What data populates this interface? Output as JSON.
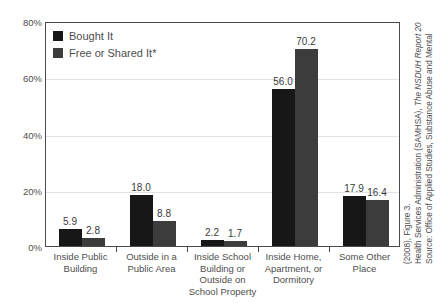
{
  "chart_data": {
    "type": "bar",
    "title": "",
    "subtitle": "",
    "xlabel": "",
    "ylabel": "",
    "ylim": [
      0,
      80
    ],
    "yticks": [
      "0%",
      "20%",
      "40%",
      "60%",
      "80%"
    ],
    "ytick_values": [
      0,
      20,
      40,
      60,
      80
    ],
    "grid": "horizontal",
    "legend_position": "top-left",
    "categories": [
      "Inside Public Building",
      "Outside in a Public Area",
      "Inside School Building or Outside on School Property",
      "Inside Home, Apartment, or Dormitory",
      "Some Other Place"
    ],
    "category_label_lines": [
      [
        "Inside Public",
        "Building"
      ],
      [
        "Outside in a",
        "Public Area"
      ],
      [
        "Inside School",
        "Building or",
        "Outside on",
        "School Property"
      ],
      [
        "Inside Home,",
        "Apartment, or",
        "Dormitory"
      ],
      [
        "Some Other",
        "Place"
      ]
    ],
    "series": [
      {
        "name": "Bought It",
        "color": "#171717",
        "values": [
          5.9,
          18.0,
          2.2,
          56.0,
          17.9
        ],
        "labels": [
          "5.9",
          "18.0",
          "2.2",
          "56.0",
          "17.9"
        ]
      },
      {
        "name": "Free or Shared It*",
        "color": "#3c3c3c",
        "values": [
          2.8,
          8.8,
          1.7,
          70.2,
          16.4
        ],
        "labels": [
          "2.8",
          "8.8",
          "1.7",
          "70.2",
          "16.4"
        ]
      }
    ]
  },
  "legend": {
    "items": [
      {
        "label": "Bought It",
        "color": "#171717"
      },
      {
        "label": "Free or Shared It*",
        "color": "#3c3c3c"
      }
    ]
  },
  "source_note": {
    "line1": "Source: Office of Applied Studies, Substance Abuse and Mental",
    "line2_a": "Health Services Administration (SAMHSA), ",
    "line2_b": "The NSDUH Report 20",
    "line3": "(2008), Figure 3."
  },
  "colors": {
    "series1": "#171717",
    "series2": "#3c3c3c",
    "axis": "#4a4a4a",
    "grid": "#e2e2e2",
    "text": "#4e4e4e",
    "background": "#ffffff"
  }
}
